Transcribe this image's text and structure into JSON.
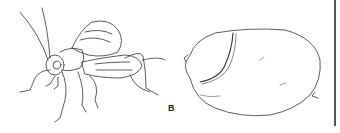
{
  "figure": {
    "panel_label": "B",
    "panels": [
      {
        "name": "insect",
        "description": "line drawing of winged insect (cricket-like) in side view"
      },
      {
        "name": "egg-or-seed",
        "description": "line drawing of oval egg/seed pod shape with ridge"
      }
    ],
    "colors": {
      "ink": "#333333",
      "background": "#ffffff",
      "divider": "#555555"
    }
  }
}
